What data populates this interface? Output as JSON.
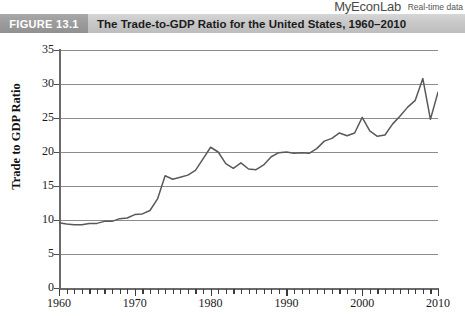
{
  "brand": {
    "product": "MyEconLab",
    "tagline": "Real-time data"
  },
  "figure": {
    "number_label": "FIGURE 13.1",
    "title": "The Trade-to-GDP Ratio for the United States, 1960–2010"
  },
  "caption": {
    "text": ""
  },
  "chart_data": {
    "type": "line",
    "title": "The Trade-to-GDP Ratio for the United States, 1960–2010",
    "xlabel": "",
    "ylabel": "Trade to GDP Ratio",
    "xlim": [
      1960,
      2010
    ],
    "ylim": [
      0,
      35
    ],
    "y_ticks": [
      0,
      5,
      10,
      15,
      20,
      25,
      30,
      35
    ],
    "x_ticks_major": [
      1960,
      1970,
      1980,
      1990,
      2000,
      2010
    ],
    "x_tick_interval_minor": 1,
    "grid": true,
    "grid_axis": "y",
    "legend": "none",
    "line_color": "#595959",
    "series": [
      {
        "name": "Trade-to-GDP Ratio",
        "x": [
          1960,
          1961,
          1962,
          1963,
          1964,
          1965,
          1966,
          1967,
          1968,
          1969,
          1970,
          1971,
          1972,
          1973,
          1974,
          1975,
          1976,
          1977,
          1978,
          1979,
          1980,
          1981,
          1982,
          1983,
          1984,
          1985,
          1986,
          1987,
          1988,
          1989,
          1990,
          1991,
          1992,
          1993,
          1994,
          1995,
          1996,
          1997,
          1998,
          1999,
          2000,
          2001,
          2002,
          2003,
          2004,
          2005,
          2006,
          2007,
          2008,
          2009,
          2010
        ],
        "values": [
          9.6,
          9.4,
          9.3,
          9.3,
          9.5,
          9.5,
          9.8,
          9.8,
          10.2,
          10.3,
          10.8,
          10.9,
          11.4,
          13.1,
          16.5,
          16.0,
          16.3,
          16.6,
          17.3,
          19.0,
          20.7,
          20.0,
          18.3,
          17.6,
          18.4,
          17.5,
          17.4,
          18.1,
          19.3,
          19.9,
          20.0,
          19.8,
          19.9,
          19.8,
          20.5,
          21.6,
          22.0,
          22.8,
          22.4,
          22.8,
          25.1,
          23.1,
          22.3,
          22.5,
          24.1,
          25.3,
          26.6,
          27.6,
          30.8,
          24.8,
          28.8
        ]
      }
    ]
  }
}
